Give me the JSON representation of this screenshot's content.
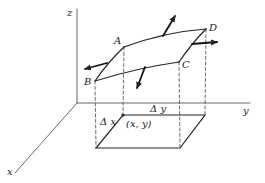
{
  "figure": {
    "axes": {
      "x": "x",
      "y": "y",
      "z": "z"
    },
    "corners": {
      "A": "A",
      "B": "B",
      "C": "C",
      "D": "D"
    },
    "base": {
      "dx": "Δ x",
      "dy": "Δ y",
      "point": "(x, y)"
    },
    "colors": {
      "ink": "#222222",
      "background": "#ffffff"
    }
  }
}
